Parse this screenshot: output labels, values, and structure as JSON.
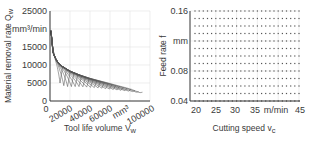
{
  "chart_data": [
    {
      "type": "scatter",
      "title": "",
      "xlabel": "Tool life volume V_w",
      "ylabel": "Material removal rate Q_w",
      "x_unit": "mm³",
      "y_unit": "mm³/min",
      "xlim": [
        0,
        100000
      ],
      "ylim": [
        0,
        25000
      ],
      "x_ticks": [
        "0",
        "20000",
        "40000",
        "60000",
        "mm³",
        "100000"
      ],
      "y_ticks": [
        "0",
        "5000",
        "10000",
        "15000",
        "mm³/min",
        "25000"
      ],
      "grid": true,
      "description": "Family of Pareto-type curves; each loop is one feed rate with cutting speed 20–45 m/min",
      "series": [
        {
          "name": "upper envelope",
          "x": [
            1000,
            3000,
            6000,
            10000,
            20000,
            30000,
            40000,
            50000,
            60000,
            70000,
            80000,
            90000
          ],
          "y": [
            19500,
            13500,
            11500,
            10000,
            8300,
            7200,
            6300,
            5600,
            4900,
            4200,
            3500,
            2500
          ]
        },
        {
          "name": "lower envelope",
          "x": [
            2000,
            5000,
            10000,
            15000,
            20000,
            30000,
            40000,
            50000,
            60000,
            70000,
            80000,
            90000
          ],
          "y": [
            17000,
            9000,
            5000,
            4000,
            4000,
            4000,
            3800,
            3600,
            3300,
            3000,
            2700,
            2300
          ]
        }
      ]
    },
    {
      "type": "scatter",
      "title": "",
      "xlabel": "Cutting speed v_c",
      "ylabel": "Feed rate f",
      "x_unit": "m/min",
      "y_unit": "mm",
      "xlim": [
        20,
        45
      ],
      "ylim": [
        0.04,
        0.16
      ],
      "x_ticks": [
        "20",
        "25",
        "30",
        "35",
        "m/min",
        "45"
      ],
      "y_ticks": [
        "0.04",
        "0.08",
        "mm",
        "0.16"
      ],
      "grid": true,
      "description": "Full factorial grid of parameter combinations",
      "grid_points": {
        "vc_start": 20,
        "vc_end": 45,
        "vc_step": 1,
        "f_start": 0.04,
        "f_end": 0.16,
        "f_step": 0.01
      }
    }
  ],
  "left": {
    "ylabel_main": "Material removal rate Q",
    "ylabel_sub": "w",
    "xlabel_main": "Tool life volume V",
    "xlabel_sub": "w",
    "y_ticks": [
      "0",
      "5000",
      "10000",
      "15000",
      "mm³/min",
      "25000"
    ],
    "x_ticks": [
      "0",
      "20000",
      "40000",
      "60000",
      "mm³",
      "100000"
    ]
  },
  "right": {
    "ylabel": "Feed rate f",
    "xlabel_main": "Cutting speed v",
    "xlabel_sub": "c",
    "y_ticks": [
      "0.04",
      "0.08",
      "mm",
      "0.16"
    ],
    "x_ticks": [
      "20",
      "25",
      "30",
      "35",
      "m/min",
      "45"
    ]
  },
  "colors": {
    "curve": "#555555",
    "axis": "#333333",
    "grid": "#e2e2e2",
    "dot": "#555555"
  }
}
